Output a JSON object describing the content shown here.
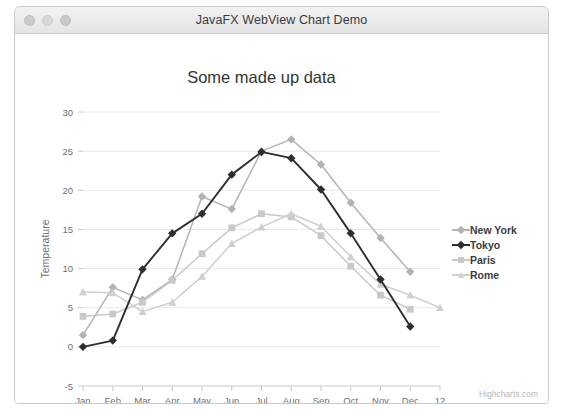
{
  "window": {
    "title": "JavaFX WebView Chart Demo",
    "traffic_lights": [
      "close-button",
      "minimize-button",
      "zoom-button"
    ]
  },
  "credits": "Highcharts.com",
  "chart_data": {
    "type": "line",
    "title": "Some made up data",
    "xlabel": "",
    "ylabel": "Temperature",
    "categories": [
      "Jan",
      "Feb",
      "Mar",
      "Apr",
      "May",
      "Jun",
      "Jul",
      "Aug",
      "Sep",
      "Oct",
      "Nov",
      "Dec",
      "12"
    ],
    "ylim": [
      -5,
      30
    ],
    "yticks": [
      -5,
      0,
      5,
      10,
      15,
      20,
      25,
      30
    ],
    "grid": true,
    "legend_position": "right",
    "series": [
      {
        "name": "New York",
        "color": "#b3b3b3",
        "marker": "diamond",
        "values": [
          1.5,
          7.6,
          6.0,
          8.6,
          19.2,
          17.6,
          25.0,
          26.5,
          23.3,
          18.4,
          13.9,
          9.6,
          null
        ]
      },
      {
        "name": "Tokyo",
        "color": "#2e2e2e",
        "marker": "diamond",
        "values": [
          0.0,
          0.8,
          9.9,
          14.5,
          17.0,
          22.0,
          24.9,
          24.1,
          20.1,
          14.5,
          8.6,
          2.6,
          null
        ]
      },
      {
        "name": "Paris",
        "color": "#c9c9c9",
        "marker": "square",
        "values": [
          3.9,
          4.2,
          5.7,
          8.5,
          11.9,
          15.2,
          17.0,
          16.6,
          14.2,
          10.3,
          6.6,
          4.8,
          null
        ]
      },
      {
        "name": "Rome",
        "color": "#cfcfcf",
        "marker": "triangle",
        "values": [
          7.0,
          6.9,
          4.5,
          5.7,
          9.0,
          13.2,
          15.3,
          17.0,
          15.4,
          11.5,
          8.0,
          6.6,
          5.0
        ]
      }
    ]
  }
}
